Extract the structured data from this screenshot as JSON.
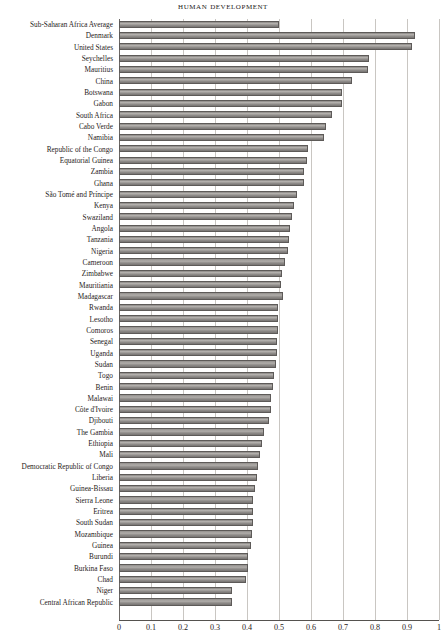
{
  "chart_data": {
    "type": "bar",
    "orientation": "horizontal",
    "title": "Human Development",
    "xlabel": "",
    "ylabel": "",
    "xlim": [
      0,
      1
    ],
    "xticks": [
      "0",
      "0.1",
      "0.2",
      "0.3",
      "0.4",
      "0.5",
      "0.6",
      "0.7",
      "0.8",
      "0.9",
      "1"
    ],
    "xtick_values": [
      0,
      0.1,
      0.2,
      0.3,
      0.4,
      0.5,
      0.6,
      0.7,
      0.8,
      0.9,
      1.0
    ],
    "grid": true,
    "legend": "none",
    "bar_color": "#93908d",
    "bar_edge_color": "#5d5a58",
    "grid_color": "#c9c6c2",
    "categories": [
      "Sub-Saharan Africa Average",
      "Denmark",
      "United States",
      "Seychelles",
      "Mauritius",
      "China",
      "Botswana",
      "Gabon",
      "South Africa",
      "Cabo Verde",
      "Namibia",
      "Republic of the Congo",
      "Equatorial Guinea",
      "Zambia",
      "Ghana",
      "São Tomé and Príncipe",
      "Kenya",
      "Swaziland",
      "Angola",
      "Tanzania",
      "Nigeria",
      "Cameroon",
      "Zimbabwe",
      "Mauritiania",
      "Madagascar",
      "Rwanda",
      "Lesotho",
      "Comoros",
      "Senegal",
      "Uganda",
      "Sudan",
      "Togo",
      "Benin",
      "Malawai",
      "Côte d'Ivoire",
      "Djibouti",
      "The Gambia",
      "Ethiopia",
      "Mali",
      "Democratic Republic of Congo",
      "Liberia",
      "Guinea-Bissau",
      "Sierra Leone",
      "Eritrea",
      "South Sudan",
      "Mozambique",
      "Guinea",
      "Burundi",
      "Burkina Faso",
      "Chad",
      "Niger",
      "Central African Republic"
    ],
    "values": [
      0.5,
      0.925,
      0.915,
      0.782,
      0.777,
      0.727,
      0.698,
      0.697,
      0.666,
      0.646,
      0.64,
      0.591,
      0.587,
      0.579,
      0.579,
      0.555,
      0.548,
      0.541,
      0.533,
      0.531,
      0.527,
      0.518,
      0.509,
      0.506,
      0.512,
      0.498,
      0.497,
      0.497,
      0.494,
      0.493,
      0.49,
      0.484,
      0.48,
      0.476,
      0.474,
      0.47,
      0.452,
      0.448,
      0.442,
      0.435,
      0.43,
      0.424,
      0.42,
      0.42,
      0.418,
      0.416,
      0.414,
      0.404,
      0.402,
      0.396,
      0.353,
      0.352
    ]
  }
}
